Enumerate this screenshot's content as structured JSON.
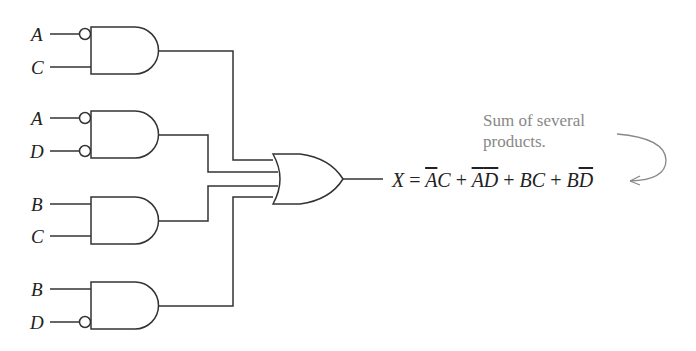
{
  "diagram": {
    "type": "logic-circuit",
    "gates": [
      {
        "id": "and1",
        "type": "AND",
        "inputs": [
          {
            "label": "A",
            "inverted": true
          },
          {
            "label": "C",
            "inverted": false
          }
        ]
      },
      {
        "id": "and2",
        "type": "AND",
        "inputs": [
          {
            "label": "A",
            "inverted": true
          },
          {
            "label": "D",
            "inverted": true
          }
        ]
      },
      {
        "id": "and3",
        "type": "AND",
        "inputs": [
          {
            "label": "B",
            "inverted": false
          },
          {
            "label": "C",
            "inverted": false
          }
        ]
      },
      {
        "id": "and4",
        "type": "AND",
        "inputs": [
          {
            "label": "B",
            "inverted": false
          },
          {
            "label": "D",
            "inverted": true
          }
        ]
      },
      {
        "id": "or1",
        "type": "OR",
        "inputs": [
          "and1",
          "and2",
          "and3",
          "and4"
        ],
        "output": "X"
      }
    ],
    "labels": {
      "g1a": "A",
      "g1b": "C",
      "g2a": "A",
      "g2b": "D",
      "g3a": "B",
      "g3b": "C",
      "g4a": "B",
      "g4b": "D"
    },
    "equation": {
      "lhs": "X",
      "eq": "=",
      "terms": [
        {
          "v1": "A",
          "v1_bar": true,
          "v2": "C",
          "v2_bar": false
        },
        {
          "v1": "A",
          "v1_bar": true,
          "v2": "D",
          "v2_bar": true
        },
        {
          "v1": "B",
          "v1_bar": false,
          "v2": "C",
          "v2_bar": false
        },
        {
          "v1": "B",
          "v1_bar": false,
          "v2": "D",
          "v2_bar": true
        }
      ],
      "plus": "+"
    },
    "annotation": {
      "line1": "Sum of several",
      "line2": "products."
    }
  }
}
